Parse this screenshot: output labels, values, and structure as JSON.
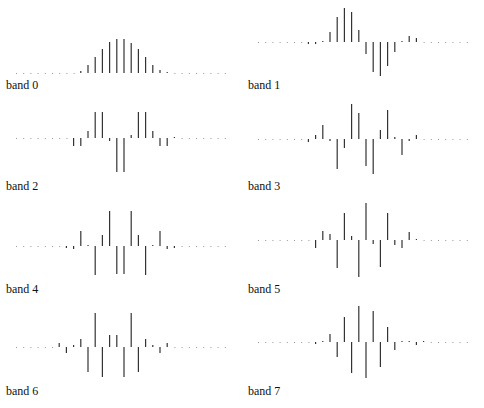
{
  "chart_data": [
    {
      "type": "stem",
      "title": "band 0",
      "label": "band 0",
      "baseline_y": 73,
      "x_start": 16,
      "x_step": 7.2,
      "values": [
        0,
        0,
        0,
        0,
        0,
        0,
        0,
        0,
        0,
        2,
        8,
        16,
        24,
        31,
        34,
        34,
        30,
        24,
        16,
        8,
        3,
        1,
        0,
        0,
        0,
        0,
        0,
        0,
        0,
        0
      ]
    },
    {
      "type": "stem",
      "title": "band 1",
      "label": "band 1",
      "baseline_y": 42,
      "x_start": 16,
      "x_step": 7.2,
      "values": [
        0,
        0,
        0,
        0,
        0,
        0,
        0,
        -2,
        -2,
        1,
        10,
        25,
        34,
        30,
        12,
        -12,
        -30,
        -34,
        -24,
        -10,
        1,
        6,
        4,
        0,
        0,
        0,
        0,
        0,
        0,
        0
      ]
    },
    {
      "type": "stem",
      "title": "band 2",
      "label": "band 2",
      "baseline_y": 38,
      "x_start": 16,
      "x_step": 7.2,
      "values": [
        0,
        0,
        0,
        0,
        0,
        0,
        0,
        0,
        -8,
        -8,
        7,
        26,
        26,
        -3,
        -34,
        -34,
        3,
        26,
        26,
        7,
        -8,
        -8,
        1,
        0,
        0,
        0,
        0,
        0,
        0,
        0
      ]
    },
    {
      "type": "stem",
      "title": "band 3",
      "label": "band 3",
      "baseline_y": 39,
      "x_start": 16,
      "x_step": 7.2,
      "values": [
        0,
        0,
        0,
        0,
        0,
        0,
        0,
        -3,
        4,
        14,
        -2,
        -30,
        -9,
        35,
        26,
        -27,
        -35,
        9,
        29,
        2,
        -16,
        -2,
        4,
        0,
        0,
        0,
        0,
        0,
        0,
        0
      ]
    },
    {
      "type": "stem",
      "title": "band 4",
      "label": "band 4",
      "baseline_y": 41,
      "x_start": 16,
      "x_step": 7.2,
      "values": [
        0,
        0,
        0,
        0,
        0,
        0,
        0,
        -2,
        -3,
        15,
        1,
        -29,
        11,
        35,
        -28,
        -28,
        35,
        11,
        -29,
        1,
        15,
        -3,
        -2,
        0,
        0,
        0,
        0,
        0,
        0,
        0
      ]
    },
    {
      "type": "stem",
      "title": "band 5",
      "label": "band 5",
      "baseline_y": 40,
      "x_start": 16,
      "x_step": 7.2,
      "values": [
        0,
        0,
        0,
        0,
        0,
        0,
        0,
        0,
        -8,
        9,
        6,
        -28,
        27,
        4,
        -37,
        37,
        -4,
        -27,
        27,
        -5,
        -8,
        8,
        1,
        0,
        0,
        0,
        0,
        0,
        0,
        0
      ]
    },
    {
      "type": "stem",
      "title": "band 6",
      "label": "band 6",
      "baseline_y": 42,
      "x_start": 16,
      "x_step": 7.2,
      "values": [
        0,
        0,
        0,
        0,
        0,
        0,
        4,
        -6,
        2,
        8,
        -25,
        34,
        -30,
        12,
        12,
        -30,
        34,
        -25,
        8,
        2,
        -6,
        4,
        0,
        0,
        0,
        0,
        0,
        0,
        0,
        0
      ]
    },
    {
      "type": "stem",
      "title": "band 7",
      "label": "band 7",
      "baseline_y": 42,
      "x_start": 16,
      "x_step": 7.2,
      "values": [
        0,
        0,
        0,
        0,
        0,
        0,
        0,
        0,
        -2,
        1,
        8,
        -15,
        25,
        -31,
        36,
        -36,
        31,
        -25,
        15,
        -8,
        1,
        1,
        -3,
        1,
        0,
        0,
        0,
        0,
        0,
        0
      ]
    }
  ],
  "panels": [
    {
      "label": "band 0"
    },
    {
      "label": "band 1"
    },
    {
      "label": "band 2"
    },
    {
      "label": "band 3"
    },
    {
      "label": "band 4"
    },
    {
      "label": "band 5"
    },
    {
      "label": "band 6"
    },
    {
      "label": "band 7"
    }
  ],
  "colors": {
    "stem": "#333333",
    "baseline_dots": "#999999",
    "text": "#111111"
  }
}
